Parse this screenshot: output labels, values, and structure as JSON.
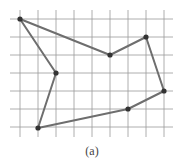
{
  "figure": {
    "caption": "(a)",
    "grid": {
      "vertical_x": [
        20,
        38,
        56,
        74,
        92,
        110,
        128,
        146,
        164
      ],
      "horizontal_y": [
        19,
        37,
        55,
        73,
        91,
        109,
        127
      ],
      "x_extent": [
        10,
        173
      ],
      "y_extent": [
        10,
        137
      ],
      "color": "#9a9a9a"
    },
    "polygon": {
      "stroke": "#6e6e6e",
      "vertex_color": "#333333",
      "vertices": [
        {
          "x": 20,
          "y": 19
        },
        {
          "x": 110,
          "y": 55
        },
        {
          "x": 146,
          "y": 37
        },
        {
          "x": 164,
          "y": 91
        },
        {
          "x": 128,
          "y": 109
        },
        {
          "x": 38,
          "y": 128
        },
        {
          "x": 56,
          "y": 73
        }
      ]
    }
  }
}
